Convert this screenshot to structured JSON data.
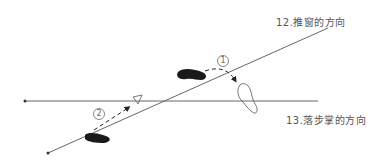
{
  "labels": {
    "line12": "12.推窗的方向",
    "line13": "13.落步掌的方向",
    "step1": "1",
    "step2": "2"
  },
  "colors": {
    "line": "#666666",
    "foot_solid": "#1a1a1a",
    "foot_outline": "#555555"
  }
}
